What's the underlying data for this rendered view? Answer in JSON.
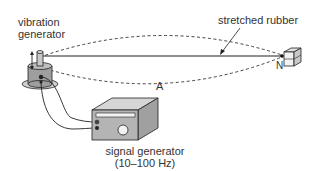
{
  "labels": {
    "vibration_generator_line1": "vibration",
    "vibration_generator_line2": "generator",
    "stretched_rubber": "stretched rubber",
    "point_a": "A",
    "point_n": "N",
    "signal_generator_line1": "signal generator",
    "signal_generator_line2": "(10–100 Hz)"
  },
  "colors": {
    "stroke": "#222222",
    "device_fill": "#a8a8a8",
    "device_light": "#d0d0d0",
    "dashed": "#444444"
  }
}
